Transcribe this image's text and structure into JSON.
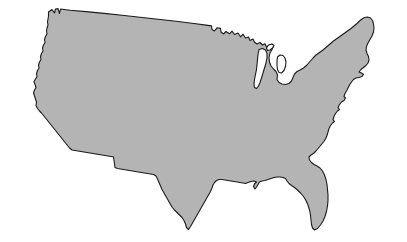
{
  "image": {
    "subject": "Continental United States map silhouette",
    "width": 407,
    "height": 242,
    "background_color": "#ffffff",
    "alt_text": "Outline map of the contiguous United States filled in gray"
  },
  "map": {
    "name": "united-states-outline",
    "projection_note": "stylized contiguous 48 states",
    "fill_color": "#b4b4b4",
    "outline_color": "#1a1a1a",
    "outline_width": 1.1,
    "lake_fill_color": "#ffffff",
    "features": [
      {
        "name": "contiguous-united-states",
        "type": "landmass",
        "fill": "#b4b4b4",
        "path": "M 48.5 12.0 L 52.0 9.5 L 54.5 13.0 L 55.5 9.0 L 58.0 8.6 L 59.5 13.5 L 60.5 9.0 L 70.0 10.2 L 86.0 11.6 L 104.0 13.4 L 122.0 15.3 L 140.0 17.2 L 158.0 19.2 L 176.0 21.3 L 194.0 23.5 L 206.0 25.1 L 211.5 25.9 L 212.0 29.5 L 214.5 31.0 L 217.0 27.8 L 220.5 28.4 L 221.0 32.0 L 223.5 34.0 L 226.0 31.5 L 229.5 33.8 L 232.0 31.2 L 234.5 34.5 L 238.0 33.0 L 240.5 36.8 L 243.0 34.2 L 245.5 38.0 L 248.5 37.0 L 250.0 40.5 L 253.0 39.0 L 254.5 42.2 L 257.0 44.0 L 260.0 42.5 L 262.5 45.0 L 265.0 43.8 L 266.5 47.0 L 269.0 45.5 L 271.5 44.2 L 273.5 46.0 L 272.0 49.5 L 270.0 53.0 L 269.0 57.5 L 269.5 62.0 L 271.0 66.0 L 273.5 69.0 L 276.0 71.5 L 277.5 75.0 L 277.0 79.5 L 279.0 82.5 L 282.0 84.0 L 285.5 84.5 L 289.0 83.5 L 291.5 81.0 L 293.0 77.5 L 294.5 74.0 L 297.0 71.5 L 300.0 70.0 L 303.5 68.0 L 307.0 65.0 L 310.0 61.5 L 313.0 58.0 L 316.0 55.0 L 319.5 52.5 L 323.0 50.0 L 326.5 47.0 L 330.0 44.0 L 333.5 41.0 L 337.0 38.5 L 340.5 36.0 L 344.0 33.5 L 347.5 31.0 L 351.0 28.5 L 354.0 26.0 L 357.0 23.5 L 359.5 21.0 L 362.0 19.0 L 364.5 17.5 L 367.5 17.0 L 370.5 18.0 L 372.5 20.5 L 373.5 24.0 L 374.0 28.0 L 373.5 32.0 L 372.0 36.0 L 370.0 39.5 L 368.0 43.0 L 366.5 46.5 L 366.0 50.0 L 367.0 53.5 L 368.5 56.5 L 369.0 60.0 L 368.0 63.0 L 366.0 65.5 L 363.5 67.5 L 361.0 69.5 L 359.0 72.0 L 361.5 73.0 L 363.5 74.5 L 362.0 76.5 L 359.0 77.5 L 356.0 78.0 L 353.5 79.5 L 351.5 82.0 L 349.5 85.0 L 348.0 88.0 L 346.5 91.0 L 345.0 93.5 L 344.0 96.5 L 345.5 98.0 L 344.0 100.5 L 341.5 102.0 L 339.5 104.5 L 338.0 107.5 L 339.5 109.5 L 337.5 111.0 L 335.5 113.5 L 334.0 116.5 L 333.0 119.5 L 334.5 121.5 L 332.5 123.0 L 330.5 125.5 L 329.0 128.5 L 328.0 132.0 L 327.0 135.5 L 325.5 139.0 L 323.5 142.0 L 321.0 145.0 L 318.5 148.0 L 316.0 151.0 L 313.5 153.5 L 311.0 155.0 L 309.0 157.0 L 309.5 160.0 L 311.5 162.5 L 314.0 164.5 L 317.0 166.0 L 320.0 168.0 L 322.5 171.0 L 324.5 175.0 L 326.0 179.5 L 327.0 184.5 L 327.5 189.5 L 328.0 195.0 L 328.0 200.5 L 327.5 206.0 L 326.5 211.5 L 325.0 216.5 L 323.0 221.0 L 320.5 225.0 L 317.5 228.5 L 314.5 230.0 L 312.5 228.0 L 311.5 224.5 L 311.0 220.0 L 310.5 215.0 L 309.5 210.0 L 308.0 205.0 L 306.0 200.5 L 303.5 196.5 L 300.5 193.0 L 297.5 190.0 L 294.5 187.5 L 291.5 185.5 L 289.0 183.5 L 287.0 181.0 L 285.5 178.5 L 283.0 177.5 L 280.0 177.0 L 277.0 177.0 L 274.0 177.5 L 271.0 178.5 L 268.0 179.5 L 265.0 180.5 L 262.0 181.0 L 259.5 182.0 L 258.0 184.5 L 256.5 187.0 L 255.0 189.0 L 253.5 186.5 L 254.5 184.0 L 256.5 182.0 L 254.0 181.0 L 251.0 181.5 L 248.0 182.5 L 245.5 183.5 L 243.0 183.0 L 240.0 182.5 L 237.0 182.0 L 234.0 181.5 L 231.0 181.0 L 228.0 180.5 L 225.0 180.0 L 222.0 179.5 L 219.0 179.5 L 216.5 180.5 L 214.5 182.5 L 213.0 185.0 L 212.0 188.0 L 210.5 191.5 L 208.5 195.0 L 206.5 198.5 L 204.5 202.0 L 202.5 205.5 L 200.5 209.0 L 198.5 212.5 L 196.5 216.0 L 194.5 219.5 L 192.5 223.0 L 190.5 226.5 L 188.5 229.5 L 186.5 227.5 L 185.5 224.0 L 184.0 220.5 L 182.0 217.5 L 179.5 215.0 L 177.0 212.5 L 174.5 210.0 L 172.0 207.0 L 170.0 203.5 L 168.0 200.0 L 166.0 196.5 L 164.0 193.0 L 162.0 189.5 L 160.5 186.0 L 159.0 182.5 L 157.5 179.0 L 156.0 176.0 L 153.5 174.5 L 150.5 174.0 L 147.5 173.5 L 144.5 173.0 L 141.5 172.5 L 138.5 172.0 L 135.5 171.5 L 132.5 171.0 L 129.5 170.5 L 126.5 170.0 L 123.5 169.5 L 120.5 169.0 L 117.5 168.5 L 115.0 167.5 L 114.5 164.0 L 114.0 160.5 L 113.5 157.0 L 111.0 156.5 L 108.0 156.0 L 105.0 155.5 L 102.0 155.0 L 99.0 154.5 L 96.0 154.0 L 93.0 153.5 L 90.0 153.0 L 87.0 152.5 L 84.0 152.0 L 81.0 151.5 L 78.0 151.0 L 75.0 150.5 L 72.0 150.0 L 69.5 148.0 L 67.5 145.5 L 65.5 143.0 L 63.5 140.5 L 61.5 138.0 L 59.5 135.5 L 57.5 133.0 L 55.5 130.5 L 53.5 128.0 L 51.5 125.5 L 49.5 123.0 L 47.5 120.5 L 45.5 118.0 L 43.5 115.5 L 41.5 113.0 L 39.5 111.0 L 37.5 108.5 L 36.0 105.5 L 36.5 102.0 L 35.5 99.0 L 34.5 96.0 L 33.5 93.0 L 34.5 90.0 L 36.0 87.5 L 35.0 84.5 L 34.0 81.5 L 35.5 79.0 L 37.0 76.5 L 36.5 73.5 L 37.5 70.5 L 39.0 68.0 L 38.5 65.0 L 39.5 62.0 L 41.0 59.5 L 40.5 56.5 L 41.5 53.5 L 43.0 51.0 L 42.5 48.0 L 43.5 45.0 L 45.0 42.5 L 44.5 39.5 L 45.5 36.5 L 47.0 34.0 L 46.5 31.0 L 47.0 28.0 L 48.0 25.0 L 47.5 22.0 L 48.0 19.0 L 48.5 16.0 Z"
      },
      {
        "name": "lake-michigan",
        "type": "lake",
        "fill": "#ffffff",
        "path": "M 259.0 49.5 L 262.5 48.5 L 265.5 50.0 L 267.0 53.5 L 267.0 58.0 L 266.0 63.0 L 264.5 68.0 L 263.0 73.0 L 261.5 78.0 L 260.0 82.5 L 258.5 86.0 L 256.5 88.5 L 254.5 87.5 L 254.0 84.0 L 254.5 79.5 L 255.5 74.5 L 256.5 69.5 L 257.0 64.5 L 257.5 59.5 L 258.0 54.5 Z"
      },
      {
        "name": "lake-superior-bay",
        "type": "lake",
        "fill": "#ffffff",
        "path": "M 268.5 45.0 L 272.0 44.0 L 274.0 45.5 L 272.5 48.0 L 270.0 50.0 L 267.5 50.5 L 266.5 48.0 Z"
      },
      {
        "name": "lake-huron-bay",
        "type": "lake",
        "fill": "#ffffff",
        "path": "M 277.5 57.0 L 280.0 55.0 L 283.0 55.5 L 285.0 58.0 L 286.0 62.0 L 285.5 66.5 L 284.0 70.5 L 281.5 73.0 L 279.0 72.5 L 277.5 69.5 L 277.0 65.0 L 277.0 60.5 Z"
      }
    ]
  }
}
